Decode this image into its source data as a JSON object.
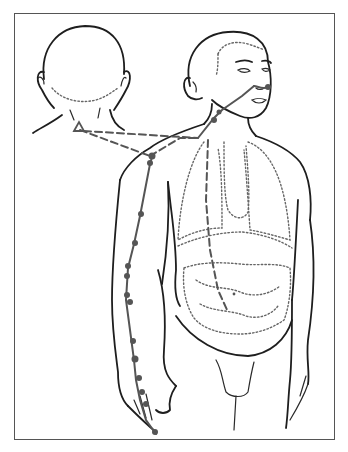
{
  "figure": {
    "colors": {
      "outline": "#1e1e1e",
      "meridian": "#555555",
      "organs": "#666666",
      "frame": "#555555",
      "background": "#ffffff"
    },
    "views": [
      {
        "name": "back-of-head-view",
        "label": "Posterior head and neck"
      },
      {
        "name": "front-body-view",
        "label": "Anterior body with organs"
      }
    ],
    "organs": [
      "lungs",
      "diaphragm",
      "large-intestine"
    ],
    "acupoints": {
      "count": 20,
      "arm_points": 14,
      "neck_face_points": 4,
      "c7_marker": "triangle"
    }
  }
}
